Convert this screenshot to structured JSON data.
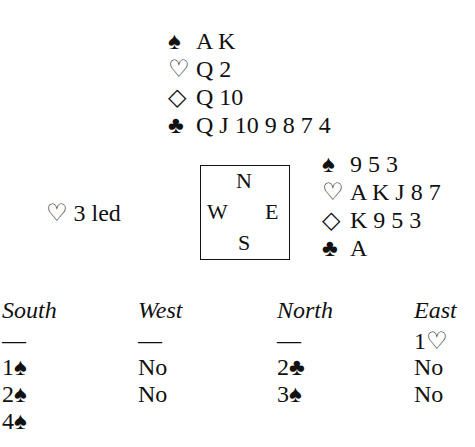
{
  "north": {
    "spades": {
      "symbol": "♠",
      "cards": "A K"
    },
    "hearts": {
      "symbol": "♡",
      "cards": "Q 2"
    },
    "diamonds": {
      "symbol": "◇",
      "cards": "Q 10"
    },
    "clubs": {
      "symbol": "♣",
      "cards": "Q J 10 9 8 7 4"
    }
  },
  "east": {
    "spades": {
      "symbol": "♠",
      "cards": "9 5 3"
    },
    "hearts": {
      "symbol": "♡",
      "cards": "A K J 8 7"
    },
    "diamonds": {
      "symbol": "◇",
      "cards": "K 9 5 3"
    },
    "clubs": {
      "symbol": "♣",
      "cards": "A"
    }
  },
  "compass": {
    "n": "N",
    "w": "W",
    "e": "E",
    "s": "S"
  },
  "lead": {
    "symbol": "♡",
    "text": "3 led"
  },
  "auction": {
    "headers": [
      "South",
      "West",
      "North",
      "East"
    ],
    "rows": [
      [
        "—",
        "—",
        "—",
        "1♡"
      ],
      [
        "1♠",
        "No",
        "2♣",
        "No"
      ],
      [
        "2♠",
        "No",
        "3♠",
        "No"
      ],
      [
        "4♠",
        "",
        "",
        ""
      ]
    ]
  }
}
